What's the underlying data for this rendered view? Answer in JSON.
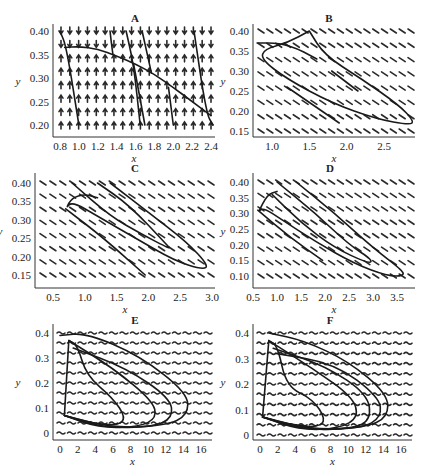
{
  "figure": {
    "panels": [
      "A",
      "B",
      "C",
      "D",
      "E",
      "F"
    ]
  },
  "chart_data": [
    {
      "type": "line",
      "title": "A",
      "xlabel": "x",
      "ylabel": "y",
      "xlim": [
        0.75,
        2.45
      ],
      "ylim": [
        0.18,
        0.42
      ],
      "xticks": [
        "0.8",
        "1.0",
        "1.2",
        "1.4",
        "1.6",
        "1.8",
        "2.0",
        "2.2",
        "2.4"
      ],
      "yticks": [
        "0.20",
        "0.25",
        "0.30",
        "0.35",
        "0.40"
      ],
      "field": "direction field; arrows point down above nullcline, up below",
      "grid": false,
      "series": [
        {
          "name": "nullcline",
          "x": [
            0.85,
            1.0,
            1.2,
            1.4,
            1.6,
            1.8,
            2.0,
            2.2,
            2.4
          ],
          "y": [
            0.365,
            0.367,
            0.362,
            0.347,
            0.33,
            0.308,
            0.28,
            0.25,
            0.22
          ]
        },
        {
          "name": "traj1",
          "x": [
            0.8,
            0.87,
            1.0
          ],
          "y": [
            0.4,
            0.365,
            0.2
          ]
        },
        {
          "name": "traj2",
          "x": [
            1.33,
            1.36
          ],
          "y": [
            0.4,
            0.35
          ]
        },
        {
          "name": "traj3",
          "x": [
            1.5,
            1.58,
            1.65
          ],
          "y": [
            0.4,
            0.33,
            0.2
          ]
        },
        {
          "name": "traj4",
          "x": [
            1.58,
            1.7
          ],
          "y": [
            0.33,
            0.2
          ]
        },
        {
          "name": "traj5",
          "x": [
            1.67,
            1.77
          ],
          "y": [
            0.4,
            0.31
          ]
        },
        {
          "name": "traj6",
          "x": [
            1.95,
            2.0
          ],
          "y": [
            0.28,
            0.2
          ]
        },
        {
          "name": "traj7",
          "x": [
            2.22,
            2.35,
            2.42
          ],
          "y": [
            0.4,
            0.225,
            0.2
          ]
        }
      ]
    },
    {
      "type": "line",
      "title": "B",
      "xlabel": "x",
      "ylabel": "y",
      "xlim": [
        0.75,
        3.0
      ],
      "ylim": [
        0.14,
        0.42
      ],
      "xticks": [
        "1.0",
        "1.5",
        "2.0",
        "2.5"
      ],
      "yticks": [
        "0.15",
        "0.20",
        "0.25",
        "0.30",
        "0.35",
        "0.40"
      ],
      "field": "direction field; short diagonal dashes sloping down-right",
      "grid": false,
      "series": [
        {
          "name": "orbit",
          "x": [
            0.8,
            1.1,
            1.35,
            1.5,
            1.6
          ],
          "y": [
            0.37,
            0.37,
            0.355,
            0.34,
            0.33
          ]
        },
        {
          "name": "loop",
          "x": [
            1.5,
            1.2,
            0.9,
            0.85,
            1.2,
            1.8,
            2.4,
            2.85,
            2.9,
            2.7,
            2.2,
            1.7,
            1.5
          ],
          "y": [
            0.4,
            0.37,
            0.355,
            0.33,
            0.28,
            0.22,
            0.18,
            0.165,
            0.175,
            0.215,
            0.28,
            0.34,
            0.4
          ]
        },
        {
          "name": "traj_mid",
          "x": [
            1.8,
            2.15
          ],
          "y": [
            0.3,
            0.25
          ]
        },
        {
          "name": "traj_low",
          "x": [
            1.2,
            1.9
          ],
          "y": [
            0.26,
            0.17
          ]
        }
      ]
    },
    {
      "type": "line",
      "title": "C",
      "xlabel": "x",
      "ylabel": "y",
      "xlim": [
        0.5,
        3.0
      ],
      "ylim": [
        0.13,
        0.42
      ],
      "xticks": [
        "0.5",
        "1.0",
        "1.5",
        "2.0",
        "2.5",
        "3.0"
      ],
      "yticks": [
        "0.15",
        "0.20",
        "0.25",
        "0.30",
        "0.35",
        "0.40"
      ],
      "field": "direction field; short diagonal dashes sloping down-right",
      "grid": false,
      "series": [
        {
          "name": "outer",
          "x": [
            1.4,
            2.0,
            2.6,
            2.95,
            2.85,
            2.4,
            1.8,
            1.2,
            0.8,
            0.7,
            0.8,
            1.0,
            1.2
          ],
          "y": [
            0.4,
            0.32,
            0.24,
            0.175,
            0.165,
            0.19,
            0.25,
            0.31,
            0.35,
            0.33,
            0.36,
            0.37,
            0.36
          ]
        },
        {
          "name": "traj_a",
          "x": [
            0.7,
            1.3,
            1.95
          ],
          "y": [
            0.33,
            0.25,
            0.15
          ]
        },
        {
          "name": "inner",
          "x": [
            1.2,
            1.7,
            2.3,
            2.35,
            1.9,
            1.4,
            0.8
          ],
          "y": [
            0.4,
            0.34,
            0.23,
            0.22,
            0.26,
            0.31,
            0.4
          ]
        }
      ]
    },
    {
      "type": "line",
      "title": "D",
      "xlabel": "x",
      "ylabel": "y",
      "xlim": [
        0.5,
        3.8
      ],
      "ylim": [
        0.08,
        0.42
      ],
      "xticks": [
        "0.5",
        "1.0",
        "1.5",
        "2.0",
        "2.5",
        "3.0",
        "3.5"
      ],
      "yticks": [
        "0.10",
        "0.15",
        "0.20",
        "0.25",
        "0.30",
        "0.35",
        "0.40"
      ],
      "field": "direction field; short diagonal dashes sloping down-right",
      "grid": false,
      "series": [
        {
          "name": "outer",
          "x": [
            1.4,
            2.2,
            3.0,
            3.6,
            3.65,
            3.3,
            2.6,
            1.8,
            1.1,
            0.7,
            0.6,
            0.8,
            1.0
          ],
          "y": [
            0.4,
            0.3,
            0.19,
            0.12,
            0.1,
            0.1,
            0.14,
            0.21,
            0.28,
            0.32,
            0.3,
            0.36,
            0.37
          ]
        },
        {
          "name": "middle",
          "x": [
            1.0,
            1.8,
            2.5,
            3.0,
            2.9,
            2.2,
            1.5,
            0.9
          ],
          "y": [
            0.4,
            0.3,
            0.2,
            0.15,
            0.14,
            0.19,
            0.27,
            0.36
          ]
        },
        {
          "name": "traj_low",
          "x": [
            0.6,
            1.3,
            1.95
          ],
          "y": [
            0.31,
            0.22,
            0.15
          ]
        }
      ]
    },
    {
      "type": "line",
      "title": "E",
      "xlabel": "x",
      "ylabel": "y",
      "xlim": [
        -0.5,
        17
      ],
      "ylim": [
        -0.02,
        0.42
      ],
      "xticks": [
        "0",
        "2",
        "4",
        "6",
        "8",
        "10",
        "12",
        "14",
        "16"
      ],
      "yticks": [
        "0",
        "0.1",
        "0.2",
        "0.3",
        "0.4"
      ],
      "field": "direction field; wavy horizontal dashes",
      "grid": false,
      "series": [
        {
          "name": "inner",
          "x": [
            1.0,
            2.0,
            3.0,
            6.0,
            7.5,
            6.5,
            3.5,
            0.5,
            0.5,
            1.0
          ],
          "y": [
            0.37,
            0.35,
            0.23,
            0.14,
            0.06,
            0.03,
            0.04,
            0.07,
            0.07,
            0.37
          ]
        },
        {
          "name": "orbit2",
          "x": [
            1.0,
            6.0,
            10.5,
            11.0,
            9.0,
            4.5,
            0.5
          ],
          "y": [
            0.37,
            0.26,
            0.13,
            0.06,
            0.025,
            0.02,
            0.07
          ]
        },
        {
          "name": "orbit3",
          "x": [
            1.5,
            7.5,
            12.5,
            12.8,
            10.5,
            5.0,
            0.5
          ],
          "y": [
            0.34,
            0.26,
            0.14,
            0.06,
            0.025,
            0.02,
            0.07
          ]
        },
        {
          "name": "outer",
          "x": [
            0.0,
            3.0,
            9.0,
            14.5,
            14.5,
            12.0,
            6.0,
            0.5
          ],
          "y": [
            0.39,
            0.4,
            0.31,
            0.16,
            0.07,
            0.03,
            0.02,
            0.07
          ]
        }
      ]
    },
    {
      "type": "line",
      "title": "F",
      "xlabel": "x",
      "ylabel": "y",
      "xlim": [
        -0.5,
        17
      ],
      "ylim": [
        -0.02,
        0.42
      ],
      "xticks": [
        "0",
        "2",
        "4",
        "6",
        "8",
        "10",
        "12",
        "14",
        "16"
      ],
      "yticks": [
        "0",
        "0.1",
        "0.2",
        "0.3",
        "0.4"
      ],
      "field": "direction field; wavy horizontal dashes",
      "grid": false,
      "series": [
        {
          "name": "inner",
          "x": [
            1.0,
            2.0,
            3.0,
            6.0,
            7.5,
            6.5,
            3.5,
            0.3,
            0.3,
            1.0
          ],
          "y": [
            0.37,
            0.35,
            0.19,
            0.14,
            0.06,
            0.03,
            0.04,
            0.07,
            0.07,
            0.37
          ]
        },
        {
          "name": "orbit2",
          "x": [
            1.0,
            6.0,
            10.5,
            11.2,
            9.0,
            4.5,
            0.3
          ],
          "y": [
            0.37,
            0.26,
            0.15,
            0.07,
            0.025,
            0.02,
            0.07
          ]
        },
        {
          "name": "orbit3",
          "x": [
            1.5,
            7.5,
            12.2,
            12.6,
            10.5,
            5.0,
            0.3
          ],
          "y": [
            0.34,
            0.27,
            0.16,
            0.06,
            0.025,
            0.02,
            0.07
          ]
        },
        {
          "name": "orbit4",
          "x": [
            1.8,
            8.5,
            13.5,
            13.8,
            11.5,
            5.0,
            0.3
          ],
          "y": [
            0.32,
            0.28,
            0.15,
            0.07,
            0.025,
            0.02,
            0.07
          ]
        },
        {
          "name": "outer",
          "x": [
            1.0,
            5.0,
            10.0,
            14.5,
            14.5,
            12.0,
            6.0,
            0.3
          ],
          "y": [
            0.4,
            0.37,
            0.29,
            0.16,
            0.07,
            0.03,
            0.02,
            0.07
          ]
        }
      ]
    }
  ]
}
